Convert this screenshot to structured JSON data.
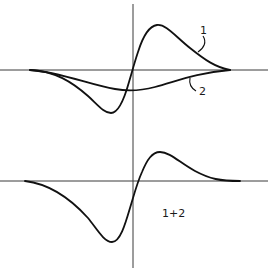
{
  "figure": {
    "top_panel": {
      "curve_labels": [
        "1",
        "2"
      ],
      "description": "Two curves: derivative-like curve 1 (positive peak right, negative trough left) and shallow negative curve 2"
    },
    "bottom_panel": {
      "label": "1+2",
      "description": "Sum of curves 1 and 2"
    },
    "colors": {
      "line": "#111111",
      "axis": "#3a3a3a",
      "background": "#ffffff"
    }
  }
}
